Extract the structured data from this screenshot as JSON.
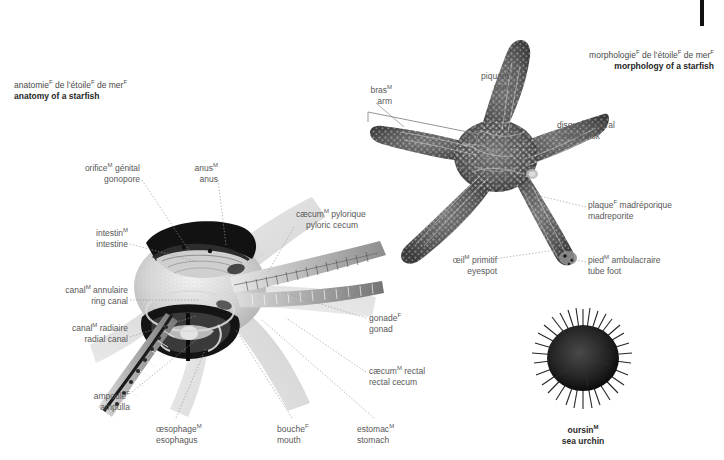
{
  "page": {
    "width": 724,
    "height": 460,
    "background": "#ffffff",
    "label_color": "#585858",
    "heading_color": "#262626"
  },
  "titles": {
    "anatomy": {
      "fr_pre": "anatomie",
      "fr_sup1": "F",
      "fr_mid": " de l’étoile",
      "fr_sup2": "F",
      "fr_mid2": " de mer",
      "fr_sup3": "F",
      "en": "anatomy of a starfish"
    },
    "morphology": {
      "fr_pre": "morphologie",
      "fr_sup1": "F",
      "fr_mid": " de l’étoile",
      "fr_sup2": "F",
      "fr_mid2": " de mer",
      "fr_sup3": "F",
      "en": "morphology of a starfish"
    }
  },
  "anatomy_labels": [
    {
      "id": "gonopore",
      "fr": "orifice",
      "sup": "M",
      "fr_tail": " génital",
      "en": "gonopore",
      "x": 72,
      "y": 163,
      "align": "right",
      "w": 68
    },
    {
      "id": "anus",
      "fr": "anus",
      "sup": "M",
      "fr_tail": "",
      "en": "anus",
      "x": 186,
      "y": 163,
      "align": "right",
      "w": 32
    },
    {
      "id": "intestine",
      "fr": "intestin",
      "sup": "M",
      "fr_tail": "",
      "en": "intestine",
      "x": 84,
      "y": 228,
      "align": "right",
      "w": 44
    },
    {
      "id": "ring-canal",
      "fr": "canal",
      "sup": "M",
      "fr_tail": " annulaire",
      "en": "ring canal",
      "x": 58,
      "y": 285,
      "align": "right",
      "w": 70
    },
    {
      "id": "radial-canal",
      "fr": "canal",
      "sup": "M",
      "fr_tail": " radiaire",
      "en": "radial canal",
      "x": 60,
      "y": 323,
      "align": "right",
      "w": 68
    },
    {
      "id": "ampulla",
      "fr": "ampoule",
      "sup": "F",
      "fr_tail": "",
      "en": "ampulla",
      "x": 82,
      "y": 391,
      "align": "right",
      "w": 48
    },
    {
      "id": "esophagus",
      "fr": "œsophage",
      "sup": "M",
      "fr_tail": "",
      "en": "esophagus",
      "x": 156,
      "y": 424,
      "align": "left",
      "w": 60
    },
    {
      "id": "mouth",
      "fr": "bouche",
      "sup": "F",
      "fr_tail": "",
      "en": "mouth",
      "x": 277,
      "y": 424,
      "align": "left",
      "w": 40
    },
    {
      "id": "stomach",
      "fr": "estomac",
      "sup": "M",
      "fr_tail": "",
      "en": "stomach",
      "x": 357,
      "y": 424,
      "align": "left",
      "w": 48
    },
    {
      "id": "pyloric-cecum",
      "fr": "cæcum",
      "sup": "M",
      "fr_tail": " pylorique",
      "en": "pyloric cecum",
      "x": 296,
      "y": 209,
      "align": "left",
      "w": 76
    },
    {
      "id": "gonad",
      "fr": "gonade",
      "sup": "F",
      "fr_tail": "",
      "en": "gonad",
      "x": 369,
      "y": 313,
      "align": "left",
      "w": 40
    },
    {
      "id": "rectal-cecum",
      "fr": "cæcum",
      "sup": "M",
      "fr_tail": " rectal",
      "en": "rectal cecum",
      "x": 369,
      "y": 366,
      "align": "left",
      "w": 66
    }
  ],
  "morphology_labels": [
    {
      "id": "arm",
      "fr": "bras",
      "sup": "M",
      "fr_tail": "",
      "en": "arm",
      "x": 357,
      "y": 85,
      "align": "right",
      "w": 34
    },
    {
      "id": "spine",
      "fr": "piquant",
      "sup": "M",
      "fr_tail": "",
      "en": "spine",
      "x": 470,
      "y": 71,
      "align": "right",
      "w": 44
    },
    {
      "id": "central-disk",
      "fr": "disque",
      "sup": "M",
      "fr_tail": " central",
      "en": "central disk",
      "x": 557,
      "y": 120,
      "align": "left",
      "w": 64
    },
    {
      "id": "madreporite",
      "fr": "plaque",
      "sup": "F",
      "fr_tail": " madréporique",
      "en": "madreporite",
      "x": 588,
      "y": 200,
      "align": "left",
      "w": 88
    },
    {
      "id": "eyespot",
      "fr": "œil",
      "sup": "M",
      "fr_tail": " primitif",
      "en": "eyespot",
      "x": 497,
      "y": 255,
      "align": "right",
      "w": 58
    },
    {
      "id": "tube-foot",
      "fr": "pied",
      "sup": "M",
      "fr_tail": " ambulacraire",
      "en": "tube foot",
      "x": 588,
      "y": 255,
      "align": "left",
      "w": 78
    }
  ],
  "caption": {
    "sea_urchin": {
      "fr": "oursin",
      "sup": "M",
      "en": "sea urchin",
      "x": 570,
      "y": 425
    }
  },
  "icons": {
    "corner_mark": "black-page-edge-bar"
  }
}
